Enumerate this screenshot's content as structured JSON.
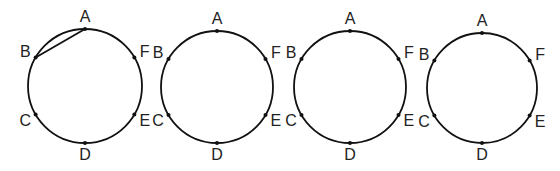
{
  "diagram": {
    "point_labels": [
      "A",
      "F",
      "E",
      "D",
      "C",
      "B"
    ],
    "circles": [
      {
        "id": "circle-1",
        "chords": [
          [
            "A",
            "B"
          ]
        ]
      },
      {
        "id": "circle-2",
        "chords": []
      },
      {
        "id": "circle-3",
        "chords": []
      },
      {
        "id": "circle-4",
        "chords": []
      }
    ],
    "colors": {
      "stroke": "#111111",
      "label": "#222222",
      "background": "#ffffff"
    }
  }
}
